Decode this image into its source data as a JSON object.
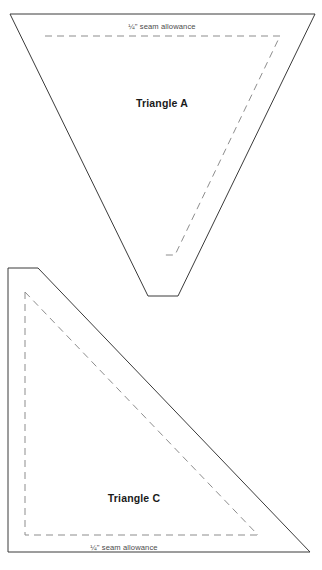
{
  "document": {
    "type": "quilting-pattern-template-sheet",
    "background_color": "#ffffff",
    "width": 322,
    "height": 570
  },
  "style": {
    "cut_line_color": "#3a3a3a",
    "seam_line_color": "#8d8d8d",
    "label_color": "#1a1a1a",
    "seam_label_color": "#4a4a4a"
  },
  "pieces": [
    {
      "id": "triangle-a",
      "label": "Triangle A",
      "label_x": 162,
      "label_y": 107,
      "seam_allowance_label": "¼\" seam allowance",
      "seam_label_x": 162,
      "seam_label_y": 29,
      "cut_outline_points": "10,14 315,14 178,296 148,296",
      "seam_outline_points": "45,36 280,36 175,255 165,255"
    },
    {
      "id": "triangle-c",
      "label": "Triangle C",
      "label_x": 134,
      "label_y": 502,
      "seam_allowance_label": "¼\" seam allowance",
      "seam_label_x": 124,
      "seam_label_y": 550,
      "cut_outline_points": "8,268 38,268 310,552 8,552",
      "seam_outline_points": "25,292 25,535 258,535"
    }
  ]
}
